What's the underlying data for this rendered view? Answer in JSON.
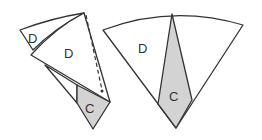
{
  "figure": {
    "colors": {
      "stroke": "#333333",
      "shaded": "#d3d3d3",
      "fill": "#ffffff"
    },
    "left": {
      "labels": {
        "small_d": "D",
        "big_d": "D",
        "c": "C"
      }
    },
    "right": {
      "labels": {
        "d": "D",
        "c": "C"
      }
    }
  }
}
